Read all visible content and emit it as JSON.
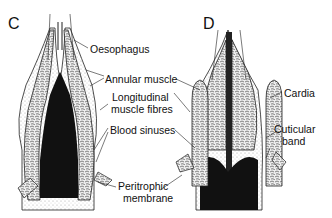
{
  "figure": {
    "panels": [
      {
        "id": "C"
      },
      {
        "id": "D"
      }
    ],
    "labels": {
      "oesophagus": "Oesophagus",
      "annular_muscle": "Annular muscle",
      "longitudinal_line1": "Longitudinal",
      "longitudinal_line2": "muscle fibres",
      "blood_sinuses": "Blood sinuses",
      "peritrophic_line1": "Peritrophic",
      "peritrophic_line2": "membrane",
      "cardia": "Cardia",
      "cuticular_line1": "Cuticular",
      "cuticular_line2": "band"
    },
    "colors": {
      "ink": "#111111",
      "background": "#ffffff",
      "stipple": "#bbbbbb"
    }
  }
}
